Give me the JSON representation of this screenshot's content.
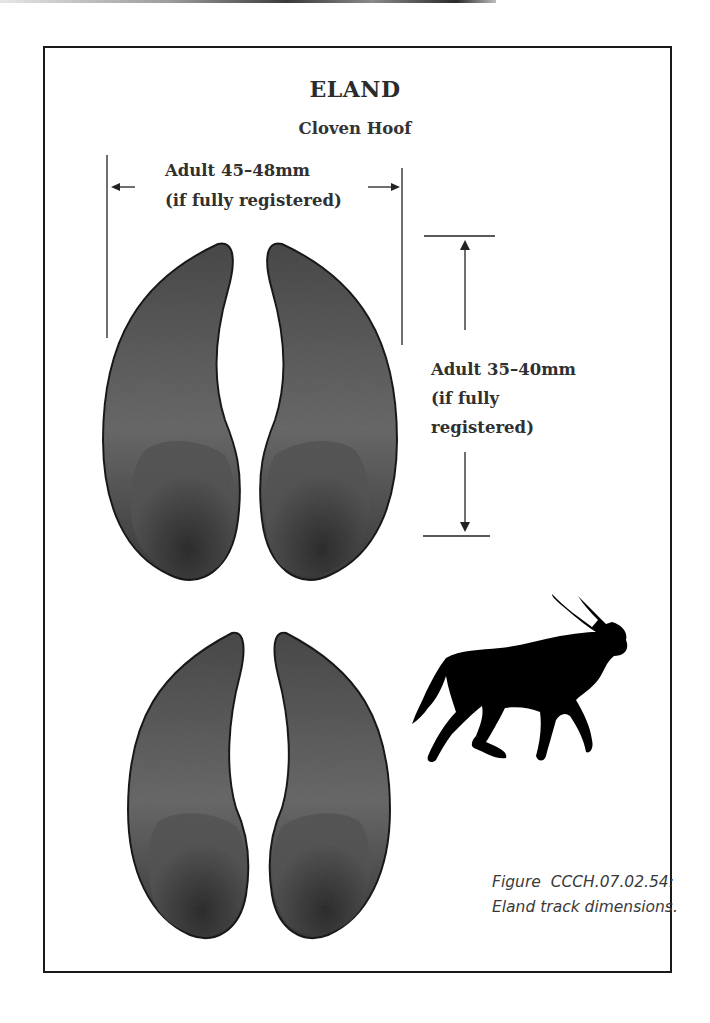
{
  "figure": {
    "title": "ELAND",
    "subtitle": "Cloven Hoof",
    "width_dimension": {
      "line1": "Adult 45–48mm",
      "line2": "(if fully registered)"
    },
    "length_dimension": {
      "line1": "Adult 35–40mm",
      "line2": "(if fully",
      "line3": "registered)"
    },
    "caption": {
      "line1": "Figure  CCCH.07.02.54:",
      "line2": "Eland track dimensions."
    },
    "illustrations": {
      "front_track": "cloven-hoof-track-upper",
      "rear_track": "cloven-hoof-track-lower",
      "animal": "eland-silhouette-icon"
    },
    "colors": {
      "hoof_fill": "#5a5a5a",
      "hoof_dark": "#2e2e2e",
      "outline": "#1a1a1a",
      "silhouette": "#000000"
    }
  }
}
